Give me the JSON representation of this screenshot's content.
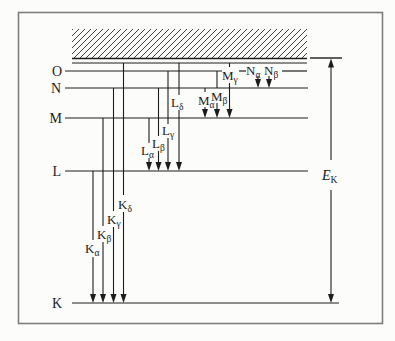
{
  "figure_title": "x-ray-energy-level-diagram",
  "diagram": {
    "colors": {
      "ink": "#1c1c1c",
      "frame": "#7d7d7d",
      "paper": "#fcfcfa",
      "hatch": "#2a2a2a"
    },
    "frame": {
      "x": 18.5,
      "y": 12.5,
      "w": 364,
      "h": 311
    },
    "hatch": {
      "x": 72,
      "y": 29,
      "w": 235,
      "h": 29,
      "spacing": 6
    },
    "levels": [
      {
        "name": "vacuum-right-segment",
        "label": "",
        "y": 58,
        "width": 1.4,
        "segments": [
          [
            310,
            342
          ]
        ]
      },
      {
        "name": "continuum-bottom",
        "label": "",
        "y": 58.5,
        "width": 1.4,
        "segments": [
          [
            72,
            307
          ]
        ]
      },
      {
        "name": "ionization-limit",
        "label": "",
        "y": 63,
        "width": 1.1,
        "segments": [
          [
            72,
            307
          ]
        ]
      },
      {
        "name": "shell-O",
        "label": "O",
        "y": 71,
        "label_x": 62,
        "width": 1.2,
        "segments": [
          [
            65,
            222
          ],
          [
            239,
            246
          ],
          [
            282,
            307
          ]
        ]
      },
      {
        "name": "shell-N",
        "label": "N",
        "y": 88,
        "label_x": 61,
        "width": 1.2,
        "segments": [
          [
            65,
            308
          ]
        ]
      },
      {
        "name": "shell-M",
        "label": "M",
        "y": 118,
        "label_x": 62,
        "width": 1.2,
        "segments": [
          [
            65,
            308
          ]
        ]
      },
      {
        "name": "shell-L",
        "label": "L",
        "y": 171,
        "label_x": 61,
        "width": 1.2,
        "segments": [
          [
            65,
            308
          ]
        ]
      },
      {
        "name": "shell-K",
        "label": "K",
        "y": 303,
        "label_x": 62,
        "width": 1.2,
        "segments": [
          [
            72,
            339
          ]
        ]
      }
    ],
    "transitions": [
      {
        "name": "K-alpha",
        "main": "K",
        "sub": "α",
        "x": 93,
        "tip": 303,
        "segments": [
          [
            171,
            240
          ],
          [
            257,
            295
          ]
        ],
        "label": {
          "x": 85,
          "y": 253
        }
      },
      {
        "name": "K-beta",
        "main": "K",
        "sub": "β",
        "x": 103,
        "tip": 303,
        "segments": [
          [
            118,
            226
          ],
          [
            242,
            295
          ]
        ],
        "label": {
          "x": 97,
          "y": 239
        }
      },
      {
        "name": "K-gamma",
        "main": "K",
        "sub": "γ",
        "x": 113.5,
        "tip": 303,
        "segments": [
          [
            88,
            211
          ],
          [
            227,
            295
          ]
        ],
        "label": {
          "x": 107,
          "y": 224
        }
      },
      {
        "name": "K-delta",
        "main": "K",
        "sub": "δ",
        "x": 123.5,
        "tip": 303,
        "segments": [
          [
            63,
            195
          ],
          [
            212,
            295
          ]
        ],
        "label": {
          "x": 118,
          "y": 209
        }
      },
      {
        "name": "L-alpha",
        "main": "L",
        "sub": "α",
        "x": 149,
        "tip": 171,
        "segments": [
          [
            118,
            143
          ],
          [
            158,
            163
          ]
        ],
        "label": {
          "x": 141,
          "y": 155
        }
      },
      {
        "name": "L-beta",
        "main": "L",
        "sub": "β",
        "x": 158.5,
        "tip": 171,
        "segments": [
          [
            88,
            136
          ],
          [
            151,
            163
          ]
        ],
        "label": {
          "x": 152,
          "y": 148
        }
      },
      {
        "name": "L-gamma",
        "main": "L",
        "sub": "γ",
        "x": 168,
        "tip": 171,
        "segments": [
          [
            71,
            124
          ],
          [
            138,
            163
          ]
        ],
        "label": {
          "x": 162,
          "y": 135
        }
      },
      {
        "name": "L-delta",
        "main": "L",
        "sub": "δ",
        "x": 179,
        "tip": 171,
        "segments": [
          [
            63,
            95
          ],
          [
            110,
            163
          ]
        ],
        "label": {
          "x": 171,
          "y": 107
        }
      },
      {
        "name": "M-alpha",
        "main": "M",
        "sub": "α",
        "x": 205,
        "tip": 118,
        "segments": [
          [
            88,
            92
          ],
          [
            107,
            110
          ]
        ],
        "label": {
          "x": 198,
          "y": 105
        }
      },
      {
        "name": "M-beta",
        "main": "M",
        "sub": "β",
        "x": 217,
        "tip": 118,
        "segments": [
          [
            71,
            88
          ],
          [
            103,
            110
          ]
        ],
        "label": {
          "x": 211,
          "y": 101
        }
      },
      {
        "name": "M-gamma",
        "main": "M",
        "sub": "γ",
        "x": 229.5,
        "tip": 118,
        "segments": [
          [
            63,
            67
          ],
          [
            83,
            110
          ]
        ],
        "label": {
          "x": 222,
          "y": 80
        }
      },
      {
        "name": "N-alpha",
        "main": "N",
        "sub": "α",
        "x": 258,
        "tip": 88,
        "segments": [
          [
            76,
            81
          ]
        ],
        "label": {
          "x": 246,
          "y": 75
        }
      },
      {
        "name": "N-beta",
        "main": "N",
        "sub": "β",
        "x": 269,
        "tip": 88,
        "segments": [
          [
            76,
            81
          ]
        ],
        "label": {
          "x": 264,
          "y": 75
        }
      }
    ],
    "ek": {
      "name": "E-K-binding-energy",
      "main": "E",
      "sub": "K",
      "x": 331,
      "top": 58.5,
      "bottom": 303,
      "segments": [
        [
          67,
          160
        ],
        [
          190,
          294
        ]
      ],
      "label": {
        "x": 322,
        "y": 180
      }
    }
  }
}
